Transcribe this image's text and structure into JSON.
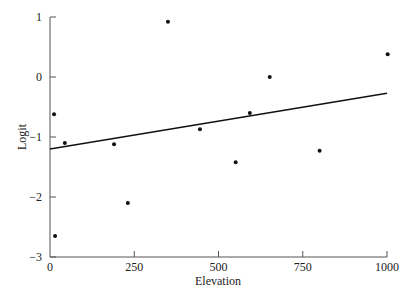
{
  "chart_data": {
    "type": "scatter",
    "title": "",
    "xlabel": "Elevation",
    "ylabel": "Logit",
    "xlim": [
      0,
      1000
    ],
    "ylim": [
      -3,
      1
    ],
    "xticks": [
      0,
      250,
      500,
      750,
      1000
    ],
    "yticks": [
      1,
      0,
      -1,
      -2,
      -3
    ],
    "grid": false,
    "legend": null,
    "series": [
      {
        "name": "observations",
        "type": "scatter",
        "points": [
          {
            "x": 12,
            "y": -0.62
          },
          {
            "x": 15,
            "y": -2.65
          },
          {
            "x": 44,
            "y": -1.1
          },
          {
            "x": 190,
            "y": -1.12
          },
          {
            "x": 231,
            "y": -2.1
          },
          {
            "x": 350,
            "y": 0.92
          },
          {
            "x": 445,
            "y": -0.87
          },
          {
            "x": 551,
            "y": -1.42
          },
          {
            "x": 593,
            "y": -0.6
          },
          {
            "x": 652,
            "y": 0.0
          },
          {
            "x": 800,
            "y": -1.23
          },
          {
            "x": 1002,
            "y": 0.38
          }
        ]
      },
      {
        "name": "fitted line",
        "type": "line",
        "points": [
          {
            "x": 0,
            "y": -1.2
          },
          {
            "x": 1000,
            "y": -0.27
          }
        ]
      }
    ]
  }
}
